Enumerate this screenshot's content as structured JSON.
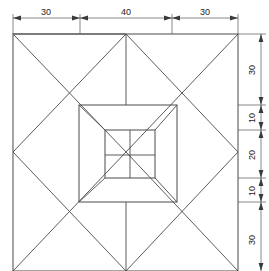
{
  "drawing": {
    "title": "Orthographic plan view of a stepped pyramidal block",
    "type": "engineering-drawing",
    "line_color": "#4a4a4a",
    "dimension_line_color": "#555555",
    "text_color": "#1a1a1a",
    "background_color": "#ffffff",
    "units": "mm"
  },
  "dimensions": {
    "horizontal": {
      "position": "top",
      "segments": [
        {
          "label": "30",
          "value": 30,
          "from": 13,
          "to": 80
        },
        {
          "label": "40",
          "value": 40,
          "from": 80,
          "to": 172
        },
        {
          "label": "30",
          "value": 30,
          "from": 172,
          "to": 238
        }
      ],
      "total": 100
    },
    "vertical": {
      "position": "right",
      "segments": [
        {
          "label": "30",
          "value": 30,
          "from": 34,
          "to": 105
        },
        {
          "label": "10",
          "value": 10,
          "from": 105,
          "to": 130
        },
        {
          "label": "20",
          "value": 20,
          "from": 130,
          "to": 178
        },
        {
          "label": "10",
          "value": 10,
          "from": 178,
          "to": 202
        },
        {
          "label": "30",
          "value": 30,
          "from": 202,
          "to": 271
        }
      ],
      "total": 100
    }
  },
  "geometry": {
    "outer_square": {
      "x1": 13,
      "y1": 34,
      "x2": 238,
      "y2": 271
    },
    "middle_square": {
      "x1": 79,
      "y1": 105,
      "x2": 177,
      "y2": 202
    },
    "inner_square": {
      "x1": 105,
      "y1": 130,
      "x2": 155,
      "y2": 178
    },
    "inner_cross": {
      "vertical_x": 130,
      "horizontal_y": 155
    },
    "centre_axis_x": 126,
    "diamond_midpoints": {
      "top": [
        126,
        34
      ],
      "right": [
        238,
        152
      ],
      "bottom": [
        126,
        271
      ],
      "left": [
        13,
        152
      ]
    }
  }
}
